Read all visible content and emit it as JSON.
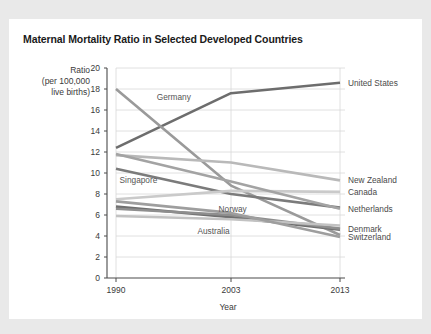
{
  "figure": {
    "title": "Maternal Mortality Ratio in Selected Developed Countries",
    "source_note": "Data from Kassebaum et al., 2014."
  },
  "chart_data": {
    "type": "line",
    "title": "Maternal Mortality Ratio in Selected Developed Countries",
    "xlabel": "Year",
    "ylabel": "Ratio\n(per 100,000\nlive births)",
    "ylabel_lines": [
      "Ratio",
      "(per 100,000",
      "live births)"
    ],
    "categories": [
      "1990",
      "2003",
      "2013"
    ],
    "x": [
      1990,
      2003,
      2013
    ],
    "xlim": [
      1990,
      2013
    ],
    "ylim": [
      0,
      20
    ],
    "yticks": [
      0,
      2,
      4,
      6,
      8,
      10,
      12,
      14,
      16,
      18,
      20
    ],
    "xticks": [
      1990,
      2003,
      2013
    ],
    "grid": "horizontal",
    "legend": "inline-labels",
    "series": [
      {
        "name": "United States",
        "values": [
          12.4,
          17.6,
          18.6
        ],
        "color": "#6d6d6d",
        "label_side": "right",
        "width": 2.6
      },
      {
        "name": "Germany",
        "values": [
          18.0,
          8.8,
          4.1
        ],
        "color": "#9a9a9a",
        "label_side": "inline",
        "width": 2.6
      },
      {
        "name": "New Zealand",
        "values": [
          11.7,
          11.0,
          9.3
        ],
        "color": "#b9b9b9",
        "label_side": "right",
        "width": 2.6
      },
      {
        "name": "Singapore",
        "values": [
          10.4,
          8.0,
          6.7
        ],
        "color": "#7b7b7b",
        "label_side": "inline",
        "width": 2.6
      },
      {
        "name": "Canada",
        "values": [
          7.5,
          8.3,
          8.2
        ],
        "color": "#cacaca",
        "label_side": "right",
        "width": 2.6
      },
      {
        "name": "Netherlands",
        "values": [
          11.8,
          9.2,
          6.6
        ],
        "color": "#a3a3a3",
        "label_side": "right",
        "width": 2.6
      },
      {
        "name": "Norway",
        "values": [
          6.8,
          5.8,
          4.6
        ],
        "color": "#6f6f6f",
        "label_side": "inline",
        "width": 2.6
      },
      {
        "name": "Denmark",
        "values": [
          6.6,
          6.0,
          4.7
        ],
        "color": "#8e8e8e",
        "label_side": "right",
        "width": 2.6
      },
      {
        "name": "Australia",
        "values": [
          5.9,
          5.6,
          5.0
        ],
        "color": "#c2c2c2",
        "label_side": "inline",
        "width": 2.6
      },
      {
        "name": "Switzerland",
        "values": [
          7.3,
          6.2,
          3.9
        ],
        "color": "#9e9e9e",
        "label_side": "right",
        "width": 2.6
      }
    ],
    "right_labels": [
      {
        "name": "United States",
        "value": 18.6
      },
      {
        "name": "New Zealand",
        "value": 9.3
      },
      {
        "name": "Canada",
        "value": 8.2
      },
      {
        "name": "Netherlands",
        "value": 6.6
      },
      {
        "name": "Denmark",
        "value": 4.7
      },
      {
        "name": "Switzerland",
        "value": 3.9
      }
    ],
    "inline_labels": [
      {
        "name": "Germany",
        "x": 1994.6,
        "y": 17.2
      },
      {
        "name": "Singapore",
        "x": 1990.4,
        "y": 9.3
      },
      {
        "name": "Norway",
        "x": 2001.6,
        "y": 6.6
      },
      {
        "name": "Australia",
        "x": 1999.2,
        "y": 4.5
      }
    ]
  }
}
